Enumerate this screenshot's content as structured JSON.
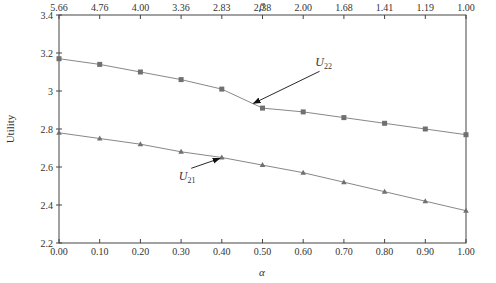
{
  "chart_data": {
    "type": "line",
    "title": "",
    "xlabel": "α",
    "x2label": "β",
    "ylabel": "Utility",
    "ylim": [
      2.2,
      3.4
    ],
    "xlim": [
      0.0,
      1.0
    ],
    "grid": false,
    "x": [
      0.0,
      0.1,
      0.2,
      0.3,
      0.4,
      0.5,
      0.6,
      0.7,
      0.8,
      0.9,
      1.0
    ],
    "x_tick_labels": [
      "0.00",
      "0.10",
      "0.20",
      "0.30",
      "0.40",
      "0.50",
      "0.60",
      "0.70",
      "0.80",
      "0.90",
      "1.00"
    ],
    "x2_tick_labels": [
      "5.66",
      "4.76",
      "4.00",
      "3.36",
      "2.83",
      "2.38",
      "2.00",
      "1.68",
      "1.41",
      "1.19",
      "1.00"
    ],
    "y_ticks": [
      2.2,
      2.4,
      2.6,
      2.8,
      3.0,
      3.2,
      3.4
    ],
    "y_tick_labels": [
      "2.2",
      "2.4",
      "2.6",
      "2.8",
      "3",
      "3.2",
      "3.4"
    ],
    "series": [
      {
        "name": "U22",
        "label_main": "U",
        "label_sub": "22",
        "marker": "square",
        "color": "#777777",
        "values": [
          3.17,
          3.14,
          3.1,
          3.06,
          3.01,
          2.91,
          2.89,
          2.86,
          2.83,
          2.8,
          2.77
        ]
      },
      {
        "name": "U21",
        "label_main": "U",
        "label_sub": "21",
        "marker": "triangle",
        "color": "#777777",
        "values": [
          2.78,
          2.75,
          2.72,
          2.68,
          2.65,
          2.61,
          2.57,
          2.52,
          2.47,
          2.42,
          2.37
        ]
      }
    ],
    "annotations": [
      {
        "series": "U22",
        "text_x": 0.65,
        "text_y": 3.13,
        "arrow_to_x": 0.478,
        "arrow_to_y": 2.935
      },
      {
        "series": "U21",
        "text_x": 0.315,
        "text_y": 2.53,
        "arrow_to_x": 0.395,
        "arrow_to_y": 2.645
      }
    ],
    "legend": null
  },
  "colors": {
    "axis": "#444444",
    "line": "#888888",
    "marker": "#707070"
  }
}
